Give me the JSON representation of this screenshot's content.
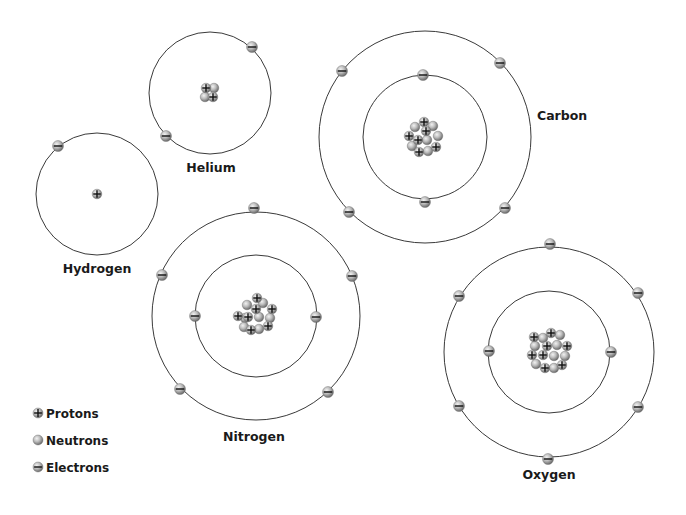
{
  "diagram": {
    "title": "",
    "colors": {
      "orbit": "#3a3a3a",
      "particle_light": "#d9d9d9",
      "particle_dark": "#6e6e6e",
      "sign": "#111111",
      "label": "#1a1a1a"
    },
    "atoms": [
      {
        "name": "Hydrogen",
        "label": "Hydrogen",
        "center": [
          97,
          194
        ],
        "label_pos": [
          97,
          273
        ],
        "label_anchor": "middle",
        "orbits": [
          61
        ],
        "electrons": [
          [
            58,
            146
          ]
        ],
        "protons": 1,
        "neutrons": 0,
        "nucleus": [
          {
            "type": "p",
            "x": 97,
            "y": 194
          }
        ]
      },
      {
        "name": "Helium",
        "label": "Helium",
        "center": [
          210,
          93
        ],
        "label_pos": [
          211,
          172
        ],
        "label_anchor": "middle",
        "orbits": [
          61
        ],
        "electrons": [
          [
            252,
            47
          ],
          [
            166,
            136
          ]
        ],
        "protons": 2,
        "neutrons": 2,
        "nucleus": [
          {
            "type": "n",
            "x": 214,
            "y": 88
          },
          {
            "type": "n",
            "x": 205,
            "y": 97
          },
          {
            "type": "p",
            "x": 206,
            "y": 88
          },
          {
            "type": "p",
            "x": 213,
            "y": 97
          }
        ]
      },
      {
        "name": "Carbon",
        "label": "Carbon",
        "center": [
          425,
          137
        ],
        "label_pos": [
          537,
          120
        ],
        "label_anchor": "start",
        "orbits": [
          62,
          106
        ],
        "electrons": [
          [
            423,
            75
          ],
          [
            425,
            202
          ],
          [
            342,
            71
          ],
          [
            500,
            63
          ],
          [
            349,
            212
          ],
          [
            505,
            208
          ]
        ],
        "protons": 6,
        "neutrons": 6,
        "nucleus": [
          {
            "type": "n",
            "x": 415,
            "y": 127
          },
          {
            "type": "n",
            "x": 433,
            "y": 126
          },
          {
            "type": "n",
            "x": 438,
            "y": 136
          },
          {
            "type": "n",
            "x": 412,
            "y": 146
          },
          {
            "type": "n",
            "x": 427,
            "y": 140
          },
          {
            "type": "n",
            "x": 428,
            "y": 151
          },
          {
            "type": "p",
            "x": 424,
            "y": 122
          },
          {
            "type": "p",
            "x": 426,
            "y": 131
          },
          {
            "type": "p",
            "x": 409,
            "y": 136
          },
          {
            "type": "p",
            "x": 418,
            "y": 140
          },
          {
            "type": "p",
            "x": 436,
            "y": 147
          },
          {
            "type": "p",
            "x": 419,
            "y": 152
          }
        ]
      },
      {
        "name": "Nitrogen",
        "label": "Nitrogen",
        "center": [
          256,
          316
        ],
        "label_pos": [
          254,
          441
        ],
        "label_anchor": "middle",
        "orbits": [
          61,
          104
        ],
        "electrons": [
          [
            195,
            316
          ],
          [
            316,
            317
          ],
          [
            254,
            208
          ],
          [
            162,
            275
          ],
          [
            352,
            276
          ],
          [
            180,
            389
          ],
          [
            328,
            392
          ]
        ],
        "protons": 7,
        "neutrons": 7,
        "nucleus": [
          {
            "type": "n",
            "x": 247,
            "y": 305
          },
          {
            "type": "n",
            "x": 263,
            "y": 303
          },
          {
            "type": "n",
            "x": 245,
            "y": 318
          },
          {
            "type": "n",
            "x": 259,
            "y": 317
          },
          {
            "type": "n",
            "x": 270,
            "y": 318
          },
          {
            "type": "n",
            "x": 244,
            "y": 327
          },
          {
            "type": "n",
            "x": 259,
            "y": 329
          },
          {
            "type": "p",
            "x": 257,
            "y": 298
          },
          {
            "type": "p",
            "x": 256,
            "y": 309
          },
          {
            "type": "p",
            "x": 272,
            "y": 309
          },
          {
            "type": "p",
            "x": 238,
            "y": 316
          },
          {
            "type": "p",
            "x": 248,
            "y": 317
          },
          {
            "type": "p",
            "x": 268,
            "y": 326
          },
          {
            "type": "p",
            "x": 251,
            "y": 330
          }
        ]
      },
      {
        "name": "Oxygen",
        "label": "Oxygen",
        "center": [
          549,
          352
        ],
        "label_pos": [
          549,
          479
        ],
        "label_anchor": "middle",
        "orbits": [
          61,
          105
        ],
        "electrons": [
          [
            489,
            351
          ],
          [
            611,
            352
          ],
          [
            550,
            244
          ],
          [
            459,
            296
          ],
          [
            638,
            293
          ],
          [
            459,
            406
          ],
          [
            638,
            407
          ],
          [
            548,
            459
          ]
        ],
        "protons": 8,
        "neutrons": 8,
        "nucleus": [
          {
            "type": "n",
            "x": 543,
            "y": 338
          },
          {
            "type": "n",
            "x": 560,
            "y": 335
          },
          {
            "type": "n",
            "x": 535,
            "y": 346
          },
          {
            "type": "n",
            "x": 557,
            "y": 345
          },
          {
            "type": "n",
            "x": 554,
            "y": 356
          },
          {
            "type": "n",
            "x": 565,
            "y": 356
          },
          {
            "type": "n",
            "x": 536,
            "y": 364
          },
          {
            "type": "n",
            "x": 554,
            "y": 368
          },
          {
            "type": "p",
            "x": 534,
            "y": 337
          },
          {
            "type": "p",
            "x": 551,
            "y": 333
          },
          {
            "type": "p",
            "x": 547,
            "y": 346
          },
          {
            "type": "p",
            "x": 567,
            "y": 346
          },
          {
            "type": "p",
            "x": 532,
            "y": 355
          },
          {
            "type": "p",
            "x": 543,
            "y": 355
          },
          {
            "type": "p",
            "x": 545,
            "y": 368
          },
          {
            "type": "p",
            "x": 562,
            "y": 365
          }
        ]
      }
    ]
  },
  "legend": {
    "items": [
      {
        "icon": "proton-icon",
        "type": "p",
        "label": "Protons",
        "pos": [
          38,
          413
        ]
      },
      {
        "icon": "neutron-icon",
        "type": "n",
        "label": "Neutrons",
        "pos": [
          38,
          440
        ]
      },
      {
        "icon": "electron-icon",
        "type": "e",
        "label": "Electrons",
        "pos": [
          38,
          467
        ]
      }
    ]
  }
}
